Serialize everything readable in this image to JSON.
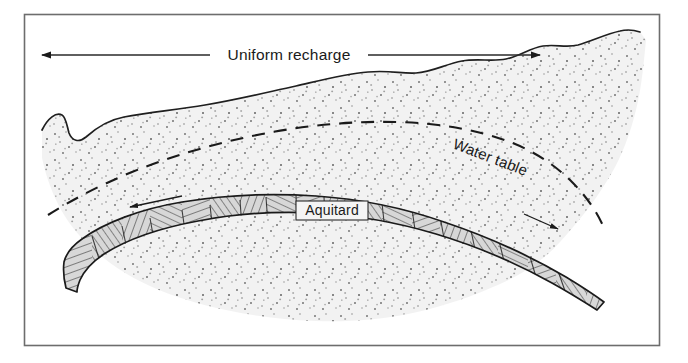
{
  "figure": {
    "kind": "hydrogeologic-cross-section",
    "frame": {
      "border_color": "#ararara",
      "stroke": "#555555"
    },
    "labels": {
      "recharge": "Uniform recharge",
      "water_table": "Water table",
      "aquitard": "Aquitard"
    },
    "colors": {
      "background": "#ffffff",
      "aquifer_fill": "#f1f1f1",
      "aquifer_stipple": "#6b6b6b",
      "aquitard_fill": "#d6d6d6",
      "aquitard_hatch": "#2b2b2b",
      "outline": "#1a1a1a",
      "frame": "#666666",
      "label_text": "#1a1a1a"
    },
    "annotations": {
      "recharge_arrow_left": "arrow pointing left",
      "recharge_arrow_right": "arrow pointing right",
      "flow_arrow_left": "groundwater flow arrow pointing left",
      "flow_arrow_right": "groundwater flow arrow pointing right",
      "water_table_style": "dashed"
    }
  }
}
